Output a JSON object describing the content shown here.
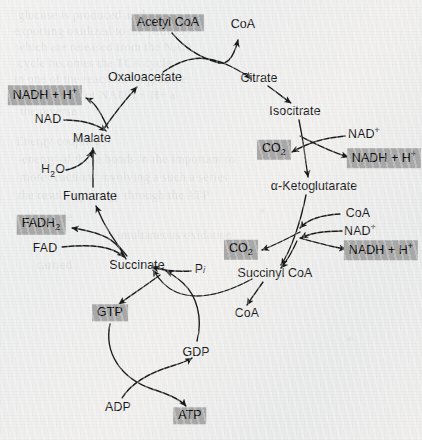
{
  "figure": {
    "type": "citric-acid-cycle-diagram",
    "highlight_color": "#a9a9a9",
    "background_color": "#eff0ef",
    "stroke_color": "#1b1b1b"
  },
  "nodes": [
    {
      "id": "acetyl-coa",
      "label": "Acetyl CoA",
      "x": 168,
      "y": 23,
      "highlight": true
    },
    {
      "id": "coa-top",
      "label": "CoA",
      "x": 243,
      "y": 24,
      "highlight": false
    },
    {
      "id": "oxaloacetate",
      "label": "Oxaloacetate",
      "x": 145,
      "y": 77,
      "highlight": false
    },
    {
      "id": "citrate",
      "label": "Citrate",
      "x": 259,
      "y": 78,
      "highlight": false
    },
    {
      "id": "isocitrate",
      "label": "Isocitrate",
      "x": 295,
      "y": 111,
      "highlight": false
    },
    {
      "id": "nadh-h-malate",
      "label": "NADH + H+",
      "x": 45,
      "y": 95,
      "highlight": true
    },
    {
      "id": "nad-malate",
      "label": "NAD",
      "x": 48,
      "y": 119,
      "highlight": false
    },
    {
      "id": "malate",
      "label": "Malate",
      "x": 92,
      "y": 138,
      "highlight": false
    },
    {
      "id": "nad-plus-iso",
      "label": "NAD+",
      "x": 364,
      "y": 133,
      "highlight": false
    },
    {
      "id": "co2-iso",
      "label": "CO2",
      "x": 274,
      "y": 150,
      "highlight": true
    },
    {
      "id": "nadh-h-iso",
      "label": "NADH + H+",
      "x": 384,
      "y": 158,
      "highlight": true
    },
    {
      "id": "h2o",
      "label": "H2O",
      "x": 53,
      "y": 171,
      "highlight": false
    },
    {
      "id": "alpha-ketoglutarate",
      "label": "α-Ketoglutarate",
      "x": 314,
      "y": 186,
      "highlight": false
    },
    {
      "id": "fumarate",
      "label": "Fumarate",
      "x": 90,
      "y": 196,
      "highlight": false
    },
    {
      "id": "coa-akg",
      "label": "CoA",
      "x": 358,
      "y": 213,
      "highlight": false
    },
    {
      "id": "fadh2",
      "label": "FADH2",
      "x": 41,
      "y": 225,
      "highlight": true
    },
    {
      "id": "nad-plus-akg",
      "label": "NAD+",
      "x": 360,
      "y": 230,
      "highlight": false
    },
    {
      "id": "fad",
      "label": "FAD",
      "x": 45,
      "y": 248,
      "highlight": false
    },
    {
      "id": "co2-akg",
      "label": "CO2",
      "x": 241,
      "y": 250,
      "highlight": true
    },
    {
      "id": "nadh-h-akg",
      "label": "NADH + H+",
      "x": 381,
      "y": 250,
      "highlight": true
    },
    {
      "id": "succinate",
      "label": "Succinate",
      "x": 137,
      "y": 265,
      "highlight": false
    },
    {
      "id": "pi",
      "label": "Pi",
      "x": 200,
      "y": 269,
      "highlight": false
    },
    {
      "id": "succinyl-coa",
      "label": "Succinyl CoA",
      "x": 275,
      "y": 273,
      "highlight": false
    },
    {
      "id": "gtp",
      "label": "GTP",
      "x": 110,
      "y": 313,
      "highlight": true
    },
    {
      "id": "coa-succ",
      "label": "CoA",
      "x": 247,
      "y": 313,
      "highlight": false
    },
    {
      "id": "gdp",
      "label": "GDP",
      "x": 196,
      "y": 352,
      "highlight": false
    },
    {
      "id": "adp",
      "label": "ADP",
      "x": 118,
      "y": 407,
      "highlight": false
    },
    {
      "id": "atp",
      "label": "ATP",
      "x": 190,
      "y": 416,
      "highlight": true
    }
  ],
  "ghost_text": [
    {
      "text": "glucose is produced as the",
      "x": 18,
      "y": 8
    },
    {
      "text": "exporting oxidized to the pathway",
      "x": 14,
      "y": 24
    },
    {
      "text": "which are released from the NAD",
      "x": 16,
      "y": 40
    },
    {
      "text": "cycle becomes the TCA cycle",
      "x": 18,
      "y": 56
    },
    {
      "text": "in one of the reactions of glucose",
      "x": 14,
      "y": 72
    },
    {
      "text": "the FAD and of NADH + H+ a",
      "x": 16,
      "y": 88
    },
    {
      "text": "the reverse",
      "x": 20,
      "y": 104
    },
    {
      "text": "Energy coupling",
      "x": 16,
      "y": 134
    },
    {
      "text": "energy of these bonds in the important to",
      "x": 22,
      "y": 152
    },
    {
      "text": "more reactions involving a such a series",
      "x": 20,
      "y": 170
    },
    {
      "text": "the resulting energy through the ATP",
      "x": 18,
      "y": 188
    },
    {
      "text": "the cycle",
      "x": 26,
      "y": 210
    },
    {
      "text": "simultaneous oxidation",
      "x": 112,
      "y": 228
    },
    {
      "text": "carried",
      "x": 36,
      "y": 258
    }
  ]
}
